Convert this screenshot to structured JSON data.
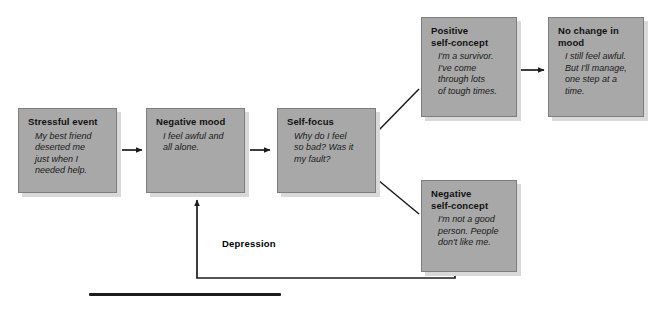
{
  "diagram": {
    "title_label": "Depression",
    "colors": {
      "box_fill": "#a8a8a8",
      "box_border": "#7d7d7d",
      "box_shadow": "#d9d9d9",
      "line": "#1c1c1c",
      "text": "#111111",
      "background": "#ffffff"
    },
    "nodes": [
      {
        "id": "stressful-event",
        "title": "Stressful event",
        "body": "My best friend\ndeserted me\njust when I\nneeded help."
      },
      {
        "id": "negative-mood",
        "title": "Negative mood",
        "body": "I feel awful and\nall alone."
      },
      {
        "id": "self-focus",
        "title": "Self-focus",
        "body": "Why do I feel\nso bad? Was it\nmy fault?"
      },
      {
        "id": "positive-self-concept",
        "title": "Positive\nself-concept",
        "body": "I'm a survivor.\nI've come\nthrough lots\nof tough times."
      },
      {
        "id": "no-change-in-mood",
        "title": "No change in\nmood",
        "body": "I still feel awful.\nBut I'll manage,\none step at a\ntime."
      },
      {
        "id": "negative-self-concept",
        "title": "Negative\nself-concept",
        "body": "I'm not a good\nperson. People\ndon't like me."
      }
    ],
    "connectors": [
      {
        "from": "stressful-event",
        "to": "negative-mood",
        "style": "arrow-right"
      },
      {
        "from": "negative-mood",
        "to": "self-focus",
        "style": "arrow-right"
      },
      {
        "from": "self-focus",
        "to": "positive-self-concept",
        "style": "diagonal-up"
      },
      {
        "from": "self-focus",
        "to": "negative-self-concept",
        "style": "diagonal-down"
      },
      {
        "from": "positive-self-concept",
        "to": "no-change-in-mood",
        "style": "arrow-right"
      },
      {
        "from": "negative-self-concept",
        "to": "negative-mood",
        "style": "feedback-loop",
        "label": "Depression"
      }
    ]
  }
}
